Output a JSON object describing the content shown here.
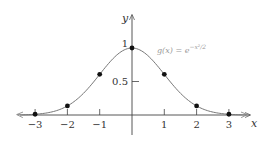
{
  "chart_data": {
    "type": "line",
    "title": "",
    "function_label": "g(x) = e^{-x²/2}",
    "function_label_text": "g(x) = e",
    "function_label_exp": "−x²/2",
    "xlabel": "x",
    "ylabel": "y",
    "xlim": [
      -3.5,
      3.5
    ],
    "ylim": [
      0,
      1.05
    ],
    "x_ticks": [
      -3,
      -2,
      -1,
      1,
      2,
      3
    ],
    "x_tick_labels": [
      "−3",
      "−2",
      "−1",
      "1",
      "2",
      "3"
    ],
    "y_ticks": [
      0.5,
      1
    ],
    "y_tick_labels": [
      "0.5",
      "1"
    ],
    "grid": false,
    "curve_color": "#777777",
    "point_color": "#111111",
    "points": [
      {
        "x": -3,
        "y": 0.011
      },
      {
        "x": -2,
        "y": 0.135
      },
      {
        "x": -1,
        "y": 0.607
      },
      {
        "x": 0,
        "y": 1.0
      },
      {
        "x": 1,
        "y": 0.607
      },
      {
        "x": 2,
        "y": 0.135
      },
      {
        "x": 3,
        "y": 0.011
      }
    ]
  }
}
